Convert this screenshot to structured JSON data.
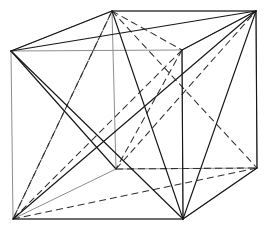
{
  "figure": {
    "type": "line-drawing",
    "background_color": "#ffffff",
    "canvas": {
      "width": 270,
      "height": 234
    },
    "styles": {
      "cube_edge_color": "#8d8d8d",
      "cube_edge_width": 1,
      "solid_edge_color": "#161616",
      "solid_edge_width": 1.15,
      "dashed_edge_color": "#303030",
      "dashed_edge_width": 1.05,
      "dash_pattern": "7 4"
    },
    "vertices": {
      "front_top_left": {
        "x": 11,
        "y": 51
      },
      "front_top_right": {
        "x": 182,
        "y": 50
      },
      "front_bottom_left": {
        "x": 13,
        "y": 219
      },
      "front_bottom_right": {
        "x": 183,
        "y": 219
      },
      "back_top_left": {
        "x": 112,
        "y": 11
      },
      "back_top_right": {
        "x": 256,
        "y": 11
      },
      "back_bottom_left": {
        "x": 116,
        "y": 169
      },
      "back_bottom_right": {
        "x": 257,
        "y": 168
      }
    },
    "cube_edges": [
      [
        "front_top_left",
        "front_top_right"
      ],
      [
        "front_top_right",
        "front_bottom_right"
      ],
      [
        "front_bottom_right",
        "front_bottom_left"
      ],
      [
        "front_bottom_left",
        "front_top_left"
      ],
      [
        "back_top_left",
        "back_top_right"
      ],
      [
        "back_top_right",
        "back_bottom_right"
      ],
      [
        "back_bottom_right",
        "back_bottom_left"
      ],
      [
        "back_bottom_left",
        "back_top_left"
      ],
      [
        "front_top_left",
        "back_top_left"
      ],
      [
        "front_top_right",
        "back_top_right"
      ],
      [
        "front_bottom_left",
        "back_bottom_left"
      ],
      [
        "front_bottom_right",
        "back_bottom_right"
      ]
    ],
    "solid_edges": [
      [
        "front_top_left",
        "back_top_left"
      ],
      [
        "front_top_left",
        "back_top_right"
      ],
      [
        "front_top_left",
        "front_bottom_right"
      ],
      [
        "front_top_left",
        "back_bottom_left"
      ],
      [
        "back_top_left",
        "back_top_right"
      ],
      [
        "back_top_right",
        "front_bottom_right"
      ],
      [
        "back_top_right",
        "front_bottom_left"
      ],
      [
        "back_top_right",
        "back_bottom_right"
      ],
      [
        "back_top_right",
        "front_top_right"
      ],
      [
        "front_bottom_left",
        "front_bottom_right"
      ],
      [
        "front_bottom_right",
        "back_bottom_right"
      ],
      [
        "front_bottom_right",
        "front_top_right"
      ],
      [
        "back_top_left",
        "front_bottom_right"
      ]
    ],
    "dashed_edges": [
      [
        "back_top_left",
        "front_bottom_left"
      ],
      [
        "back_top_left",
        "back_bottom_right"
      ],
      [
        "back_top_left",
        "front_top_right"
      ],
      [
        "front_top_right",
        "front_bottom_left"
      ],
      [
        "front_top_right",
        "back_bottom_left"
      ],
      [
        "front_bottom_left",
        "back_bottom_right"
      ],
      [
        "back_bottom_left",
        "back_bottom_right"
      ],
      [
        "back_bottom_left",
        "back_top_right"
      ],
      [
        "front_bottom_left",
        "back_top_left"
      ]
    ]
  }
}
